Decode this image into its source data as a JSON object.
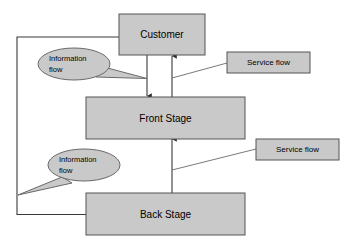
{
  "diagram": {
    "colors": {
      "shape_fill": "#c9c9c9",
      "shape_stroke": "#555555",
      "connector": "#3a3a3a",
      "background": "#ffffff"
    },
    "nodes": [
      {
        "id": "customer",
        "label": "Customer",
        "shape": "rectangle"
      },
      {
        "id": "front_stage",
        "label": "Front Stage",
        "shape": "rectangle"
      },
      {
        "id": "back_stage",
        "label": "Back Stage",
        "shape": "rectangle"
      }
    ],
    "tags": [
      {
        "id": "service_flow_top",
        "label": "Service flow",
        "shape": "rectangle"
      },
      {
        "id": "service_flow_bottom",
        "label": "Service flow",
        "shape": "rectangle"
      }
    ],
    "callouts": [
      {
        "id": "information_flow_top",
        "label_line1": "Information",
        "label_line2": "flow",
        "shape": "ellipse-callout"
      },
      {
        "id": "information_flow_bottom",
        "label_line1": "Information",
        "label_line2": "flow",
        "shape": "ellipse-callout"
      }
    ],
    "connectors": [
      {
        "id": "customer-to-front-stage",
        "from": "customer",
        "to": "front_stage",
        "arrow": "down"
      },
      {
        "id": "front-stage-to-customer",
        "from": "front_stage",
        "to": "customer",
        "arrow": "up"
      },
      {
        "id": "back-stage-to-front-stage",
        "from": "back_stage",
        "to": "front_stage",
        "arrow": "up"
      },
      {
        "id": "back-stage-to-customer-feedback",
        "from": "back_stage",
        "to": "customer",
        "arrow": "none"
      }
    ]
  }
}
